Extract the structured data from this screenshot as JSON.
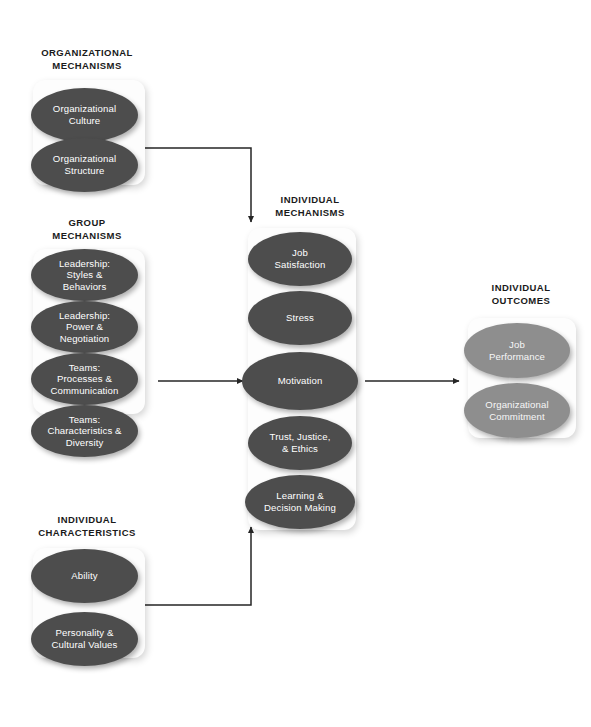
{
  "diagram": {
    "colors": {
      "node_dark": "#4d4d4d",
      "node_light": "#8e8e8e",
      "panel": "#fdfdfd",
      "connector": "#262626",
      "heading_text": "#1a1a1a",
      "node_text": "#ffffff",
      "background": "#ffffff"
    }
  },
  "sections": {
    "organizational_mechanisms": {
      "heading": "ORGANIZATIONAL\nMECHANISMS",
      "nodes": [
        {
          "label": "Organizational\nCulture",
          "style": "dark"
        },
        {
          "label": "Organizational\nStructure",
          "style": "dark"
        }
      ]
    },
    "group_mechanisms": {
      "heading": "GROUP\nMECHANISMS",
      "nodes": [
        {
          "label": "Leadership:\nStyles &\nBehaviors",
          "style": "dark"
        },
        {
          "label": "Leadership:\nPower &\nNegotiation",
          "style": "dark"
        },
        {
          "label": "Teams:\nProcesses &\nCommunication",
          "style": "dark"
        },
        {
          "label": "Teams:\nCharacteristics &\nDiversity",
          "style": "dark"
        }
      ]
    },
    "individual_characteristics": {
      "heading": "INDIVIDUAL\nCHARACTERISTICS",
      "nodes": [
        {
          "label": "Ability",
          "style": "dark"
        },
        {
          "label": "Personality &\nCultural Values",
          "style": "dark"
        }
      ]
    },
    "individual_mechanisms": {
      "heading": "INDIVIDUAL\nMECHANISMS",
      "nodes": [
        {
          "label": "Job\nSatisfaction",
          "style": "dark"
        },
        {
          "label": "Stress",
          "style": "dark"
        },
        {
          "label": "Motivation",
          "style": "dark"
        },
        {
          "label": "Trust, Justice,\n& Ethics",
          "style": "dark"
        },
        {
          "label": "Learning &\nDecision Making",
          "style": "dark"
        }
      ]
    },
    "individual_outcomes": {
      "heading": "INDIVIDUAL\nOUTCOMES",
      "nodes": [
        {
          "label": "Job\nPerformance",
          "style": "light"
        },
        {
          "label": "Organizational\nCommitment",
          "style": "light"
        }
      ]
    }
  },
  "connectors": [
    {
      "name": "organizational-to-individual-mechanisms",
      "from": "organizational_mechanisms",
      "to": "individual_mechanisms",
      "shape": "elbow-down"
    },
    {
      "name": "group-to-individual-mechanisms",
      "from": "group_mechanisms",
      "to": "individual_mechanisms",
      "shape": "straight-right"
    },
    {
      "name": "characteristics-to-individual-mechanisms",
      "from": "individual_characteristics",
      "to": "individual_mechanisms",
      "shape": "elbow-up"
    },
    {
      "name": "individual-mechanisms-to-outcomes",
      "from": "individual_mechanisms",
      "to": "individual_outcomes",
      "shape": "straight-right"
    }
  ]
}
